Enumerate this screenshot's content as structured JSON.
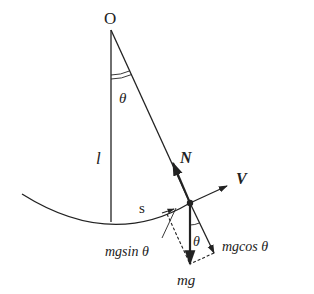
{
  "diagram": {
    "labels": {
      "pivot": "O",
      "length": "l",
      "angle_top": "θ",
      "normal_force": "N",
      "velocity": "V",
      "arc_length": "s",
      "tangential_component": "mgsin θ",
      "radial_component": "mgcos θ",
      "angle_bottom": "θ",
      "weight": "mg"
    },
    "colors": {
      "line": "#222222",
      "background": "#ffffff"
    }
  }
}
